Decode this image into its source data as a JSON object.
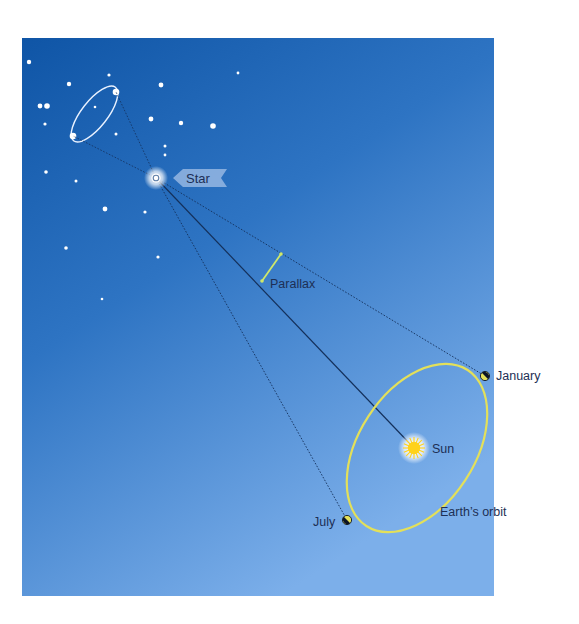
{
  "diagram": {
    "type": "stellar-parallax",
    "colors": {
      "sky_top": "#0f57a8",
      "sky_mid": "#3f80cc",
      "sky_bottom": "#7aaeea",
      "orbit": "#e3e05a",
      "parallax_bracket": "#cfe86a",
      "sun": "#ffd21a",
      "line": "#14305a",
      "text": "#1d2f55",
      "tag_fill": "#8fb3e0"
    },
    "labels": {
      "star": "Star",
      "parallax": "Parallax",
      "sun": "Sun",
      "january": "January",
      "july": "July",
      "orbit": "Earth’s orbit"
    },
    "icons": {
      "star": "target-star-icon",
      "sun": "sun-icon",
      "earth": "earth-icon"
    },
    "background_stars": [
      {
        "x": 29,
        "y": 62,
        "r": 2.2
      },
      {
        "x": 109,
        "y": 75,
        "r": 1.6
      },
      {
        "x": 69,
        "y": 84,
        "r": 2.2
      },
      {
        "x": 40,
        "y": 106,
        "r": 2.4
      },
      {
        "x": 47,
        "y": 106,
        "r": 2.8
      },
      {
        "x": 161,
        "y": 85,
        "r": 2.4
      },
      {
        "x": 45,
        "y": 124,
        "r": 1.6
      },
      {
        "x": 95,
        "y": 107,
        "r": 1.3
      },
      {
        "x": 116,
        "y": 134,
        "r": 1.5
      },
      {
        "x": 151,
        "y": 119,
        "r": 2.4
      },
      {
        "x": 181,
        "y": 123,
        "r": 2.2
      },
      {
        "x": 213,
        "y": 126,
        "r": 2.8
      },
      {
        "x": 165,
        "y": 146,
        "r": 1.5
      },
      {
        "x": 165,
        "y": 155,
        "r": 1.4
      },
      {
        "x": 46,
        "y": 172,
        "r": 1.8
      },
      {
        "x": 76,
        "y": 181,
        "r": 1.5
      },
      {
        "x": 105,
        "y": 209,
        "r": 2.4
      },
      {
        "x": 145,
        "y": 212,
        "r": 1.6
      },
      {
        "x": 66,
        "y": 248,
        "r": 1.8
      },
      {
        "x": 158,
        "y": 257,
        "r": 1.6
      },
      {
        "x": 102,
        "y": 299,
        "r": 1.3
      },
      {
        "x": 238,
        "y": 73,
        "r": 1.4
      }
    ]
  }
}
